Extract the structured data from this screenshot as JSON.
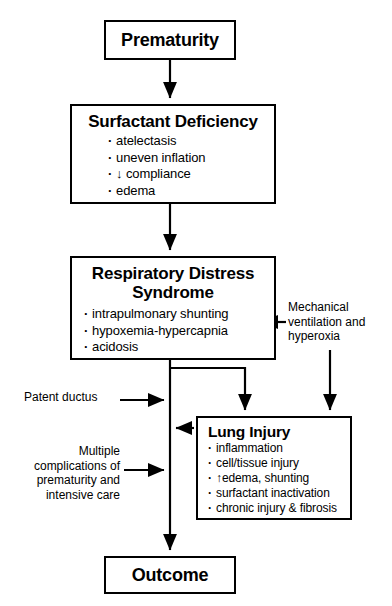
{
  "diagram": {
    "nodes": {
      "prematurity": {
        "title": "Prematurity",
        "bullets": []
      },
      "surfactant_deficiency": {
        "title": "Surfactant Deficiency",
        "bullets": [
          "atelectasis",
          "uneven inflation",
          "↓ compliance",
          "edema"
        ]
      },
      "respiratory_distress_syndrome": {
        "title": "Respiratory Distress Syndrome",
        "title_line1": "Respiratory Distress",
        "title_line2": "Syndrome",
        "bullets": [
          "intrapulmonary shunting",
          "hypoxemia-hypercapnia",
          "acidosis"
        ]
      },
      "lung_injury": {
        "title": "Lung Injury",
        "bullets": [
          "inflammation",
          "cell/tissue injury",
          "↑edema, shunting",
          "surfactant inactivation",
          "chronic injury & fibrosis"
        ]
      },
      "outcome": {
        "title": "Outcome",
        "bullets": []
      }
    },
    "side_labels": {
      "mechanical_ventilation": "Mechanical\nventilation and\nhyperoxia",
      "patent_ductus": "Patent ductus",
      "multiple_complications": "Multiple\ncomplications of\nprematurity and\nintensive care"
    },
    "edges": [
      {
        "from": "prematurity",
        "to": "surfactant_deficiency",
        "direction": "down"
      },
      {
        "from": "surfactant_deficiency",
        "to": "respiratory_distress_syndrome",
        "direction": "down"
      },
      {
        "from": "respiratory_distress_syndrome",
        "to": "lung_injury",
        "direction": "down"
      },
      {
        "from": "respiratory_distress_syndrome",
        "to": "outcome",
        "direction": "down"
      },
      {
        "from": "mechanical_ventilation",
        "to": "respiratory_distress_syndrome",
        "direction": "left"
      },
      {
        "from": "mechanical_ventilation",
        "to": "lung_injury",
        "direction": "down"
      },
      {
        "from": "patent_ductus",
        "to": "respiratory_distress_syndrome",
        "direction": "right"
      },
      {
        "from": "multiple_complications",
        "to": "outcome",
        "direction": "right"
      },
      {
        "from": "lung_injury",
        "to": "outcome",
        "direction": "left"
      }
    ],
    "colors": {
      "background": "#ffffff",
      "border": "#000000",
      "text": "#000000",
      "connector": "#000000"
    }
  }
}
